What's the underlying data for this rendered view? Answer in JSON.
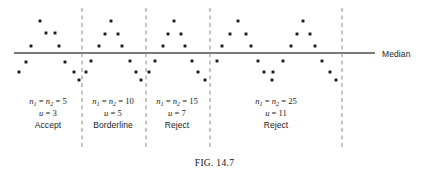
{
  "figure": {
    "caption": "FIG. 14.7",
    "caption_y": 158,
    "width": 429,
    "height": 176
  },
  "median_line": {
    "label": "Median",
    "label_x": 382,
    "label_y": 49,
    "y": 53,
    "x_start": 14,
    "x_end": 375,
    "color": "#7a7a7a",
    "thickness": 1.8
  },
  "dividers": {
    "color": "#8a8a8a",
    "y_top": 8,
    "y_bottom": 150,
    "dash": "4,3.5",
    "x_positions": [
      82,
      146,
      210,
      342
    ]
  },
  "dots": {
    "color": "#1c1c1c",
    "size": 2.9,
    "panel1": [
      {
        "x": 19,
        "y": 72
      },
      {
        "x": 26,
        "y": 62
      },
      {
        "x": 31,
        "y": 46
      },
      {
        "x": 40,
        "y": 21
      },
      {
        "x": 46,
        "y": 33
      },
      {
        "x": 55,
        "y": 33
      },
      {
        "x": 59,
        "y": 46
      },
      {
        "x": 65,
        "y": 62
      },
      {
        "x": 74,
        "y": 72
      },
      {
        "x": 79,
        "y": 80
      }
    ],
    "panel2": [
      {
        "x": 86,
        "y": 72
      },
      {
        "x": 91,
        "y": 61
      },
      {
        "x": 99,
        "y": 46
      },
      {
        "x": 105,
        "y": 34
      },
      {
        "x": 111,
        "y": 21
      },
      {
        "x": 118,
        "y": 34
      },
      {
        "x": 122,
        "y": 46
      },
      {
        "x": 130,
        "y": 61
      },
      {
        "x": 136,
        "y": 72
      },
      {
        "x": 141,
        "y": 80
      }
    ],
    "panel3": [
      {
        "x": 149,
        "y": 72
      },
      {
        "x": 155,
        "y": 61
      },
      {
        "x": 163,
        "y": 46
      },
      {
        "x": 168,
        "y": 34
      },
      {
        "x": 174,
        "y": 21
      },
      {
        "x": 181,
        "y": 34
      },
      {
        "x": 185,
        "y": 46
      },
      {
        "x": 192,
        "y": 61
      },
      {
        "x": 198,
        "y": 72
      },
      {
        "x": 205,
        "y": 80
      }
    ],
    "panel4": [
      {
        "x": 217,
        "y": 61
      },
      {
        "x": 222,
        "y": 46
      },
      {
        "x": 230,
        "y": 34
      },
      {
        "x": 238,
        "y": 21
      },
      {
        "x": 246,
        "y": 34
      },
      {
        "x": 251,
        "y": 46
      },
      {
        "x": 258,
        "y": 61
      },
      {
        "x": 264,
        "y": 72
      },
      {
        "x": 273,
        "y": 72
      },
      {
        "x": 272,
        "y": 80
      },
      {
        "x": 283,
        "y": 61
      },
      {
        "x": 291,
        "y": 46
      },
      {
        "x": 297,
        "y": 34
      },
      {
        "x": 303,
        "y": 21
      },
      {
        "x": 310,
        "y": 34
      },
      {
        "x": 315,
        "y": 46
      },
      {
        "x": 322,
        "y": 61
      },
      {
        "x": 330,
        "y": 72
      },
      {
        "x": 336,
        "y": 80
      }
    ]
  },
  "panels": [
    {
      "id": "panel-1",
      "n_label_prefix": "n",
      "n1_sub": "1",
      "n2_sub": "2",
      "n_value": "5",
      "u_symbol": "u",
      "u_value": "3",
      "verdict": "Accept",
      "center_x": 48,
      "text_y": 96
    },
    {
      "id": "panel-2",
      "n_label_prefix": "n",
      "n1_sub": "1",
      "n2_sub": "2",
      "n_value": "10",
      "u_symbol": "u",
      "u_value": "5",
      "verdict": "Borderline",
      "center_x": 113,
      "text_y": 96
    },
    {
      "id": "panel-3",
      "n_label_prefix": "n",
      "n1_sub": "1",
      "n2_sub": "2",
      "n_value": "15",
      "u_symbol": "u",
      "u_value": "7",
      "verdict": "Reject",
      "center_x": 177,
      "text_y": 96
    },
    {
      "id": "panel-4",
      "n_label_prefix": "n",
      "n1_sub": "1",
      "n2_sub": "2",
      "n_value": "25",
      "u_symbol": "u",
      "u_value": "11",
      "verdict": "Reject",
      "center_x": 276,
      "text_y": 96
    }
  ],
  "chart_data": {
    "type": "scatter",
    "title": "FIG. 14.7",
    "xlabel": "",
    "ylabel": "",
    "grid": false,
    "legend_position": "none",
    "annotations": [
      "Median",
      "n1 = n2 = 5",
      "u = 3",
      "Accept",
      "n1 = n2 = 10",
      "u = 5",
      "Borderline",
      "n1 = n2 = 15",
      "u = 7",
      "Reject",
      "n1 = n2 = 25",
      "u = 11",
      "Reject",
      "FIG. 14.7"
    ],
    "reference_lines": [
      {
        "orientation": "horizontal",
        "label": "Median",
        "style": "solid"
      },
      {
        "orientation": "vertical",
        "style": "dashed"
      },
      {
        "orientation": "vertical",
        "style": "dashed"
      },
      {
        "orientation": "vertical",
        "style": "dashed"
      },
      {
        "orientation": "vertical",
        "style": "dashed"
      }
    ],
    "series": [
      {
        "name": "n1 = n2 = 5 (u = 3, Accept)",
        "x": [
          19,
          26,
          31,
          40,
          46,
          55,
          59,
          65,
          74,
          79
        ],
        "y": [
          72,
          62,
          46,
          21,
          33,
          33,
          46,
          62,
          72,
          80
        ]
      },
      {
        "name": "n1 = n2 = 10 (u = 5, Borderline)",
        "x": [
          86,
          91,
          99,
          105,
          111,
          118,
          122,
          130,
          136,
          141
        ],
        "y": [
          72,
          61,
          46,
          34,
          21,
          34,
          46,
          61,
          72,
          80
        ]
      },
      {
        "name": "n1 = n2 = 15 (u = 7, Reject)",
        "x": [
          149,
          155,
          163,
          168,
          174,
          181,
          185,
          192,
          198,
          205
        ],
        "y": [
          72,
          61,
          46,
          34,
          21,
          34,
          46,
          61,
          72,
          80
        ]
      },
      {
        "name": "n1 = n2 = 25 (u = 11, Reject)",
        "x": [
          217,
          222,
          230,
          238,
          246,
          251,
          258,
          264,
          273,
          272,
          283,
          291,
          297,
          303,
          310,
          315,
          322,
          330,
          336
        ],
        "y": [
          61,
          46,
          34,
          21,
          34,
          46,
          61,
          72,
          72,
          80,
          61,
          46,
          34,
          21,
          34,
          46,
          61,
          72,
          80
        ]
      }
    ]
  }
}
